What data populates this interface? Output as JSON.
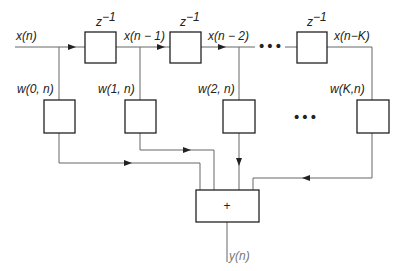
{
  "diagram": {
    "input_label": "x(n)",
    "output_label": "y(n)",
    "delay_label": "z",
    "delay_exp": "−1",
    "tap_signals": [
      "x(n − 1)",
      "x(n − 2)",
      "x(n−K)"
    ],
    "weights": [
      "w(0, n)",
      "w(1, n)",
      "w(2, n)",
      "w(K,n)"
    ],
    "adder_symbol": "+",
    "ellipsis": "•••",
    "colors": {
      "line": "#555555",
      "box": "#222222",
      "text": "#222222",
      "output": "#777777"
    }
  }
}
